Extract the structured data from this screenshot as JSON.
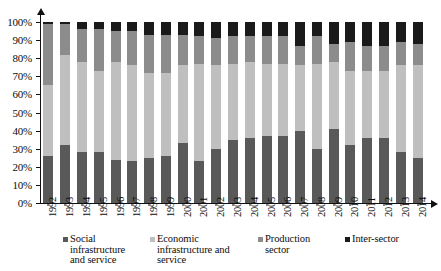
{
  "chart_data": {
    "type": "bar",
    "subtype": "stacked-100-percent",
    "title": "",
    "xlabel": "",
    "ylabel": "",
    "ylim": [
      0,
      100
    ],
    "ytick_labels": [
      "0%",
      "10%",
      "20%",
      "30%",
      "40%",
      "50%",
      "60%",
      "70%",
      "80%",
      "90%",
      "100%"
    ],
    "ytick_values": [
      0,
      10,
      20,
      30,
      40,
      50,
      60,
      70,
      80,
      90,
      100
    ],
    "grid": false,
    "legend_position": "bottom",
    "categories": [
      "1992",
      "1993",
      "1994",
      "1995",
      "1996",
      "1997",
      "1998",
      "1999",
      "2000",
      "2001",
      "2002",
      "2003",
      "2004",
      "2005",
      "2006",
      "2007",
      "2008",
      "2009",
      "2010",
      "2011",
      "2012",
      "2013",
      "2014"
    ],
    "series": [
      {
        "name": "Social infrastructure and service",
        "color": "#595959",
        "values": [
          26,
          32,
          28,
          28,
          24,
          23,
          25,
          26,
          33,
          23,
          30,
          35,
          36,
          37,
          37,
          40,
          30,
          41,
          32,
          36,
          36,
          28,
          25
        ]
      },
      {
        "name": "Economic infrastructure and service",
        "color": "#bfbfbf",
        "values": [
          39,
          50,
          50,
          45,
          54,
          53,
          47,
          46,
          43,
          54,
          46,
          42,
          42,
          40,
          40,
          36,
          47,
          37,
          41,
          37,
          37,
          48,
          51
        ]
      },
      {
        "name": "Production sector",
        "color": "#8c8c8c",
        "values": [
          34,
          17,
          18,
          23,
          17,
          19,
          21,
          21,
          17,
          15,
          15,
          15,
          14,
          15,
          15,
          11,
          15,
          10,
          16,
          14,
          14,
          13,
          12
        ]
      },
      {
        "name": "Inter-sector",
        "color": "#1a1a1a",
        "values": [
          1,
          1,
          4,
          4,
          5,
          5,
          7,
          7,
          7,
          8,
          9,
          8,
          8,
          8,
          8,
          13,
          8,
          12,
          11,
          13,
          13,
          11,
          12
        ]
      }
    ]
  },
  "legend": {
    "items": [
      {
        "id": "legend-social",
        "lines": [
          "Social",
          "infrastructure",
          "and service"
        ],
        "color": "#595959"
      },
      {
        "id": "legend-economic",
        "lines": [
          "Economic",
          "infrastructure and",
          "service"
        ],
        "color": "#bfbfbf"
      },
      {
        "id": "legend-production",
        "lines": [
          "Production",
          "sector"
        ],
        "color": "#8c8c8c"
      },
      {
        "id": "legend-intersector",
        "lines": [
          "Inter-sector"
        ],
        "color": "#1a1a1a"
      }
    ]
  },
  "axis": {
    "baseline_color": "#111111"
  }
}
